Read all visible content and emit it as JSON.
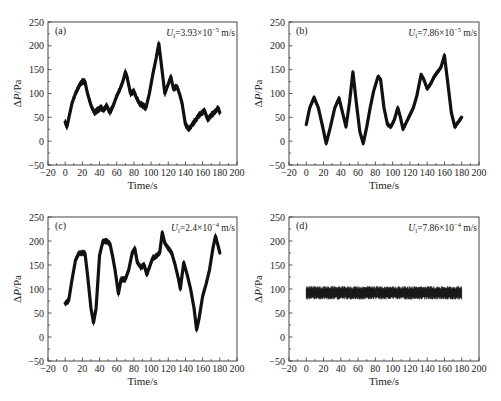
{
  "figure": {
    "layout": "2x2 grid of time-series panels",
    "background": "#ffffff",
    "line_color": "#111111"
  },
  "chart_data": [
    {
      "type": "line",
      "panel_label": "(a)",
      "annotation": {
        "symbol": "U",
        "subscript": "l",
        "text": "=3.93×10",
        "exponent": "−5",
        "unit": " m/s"
      },
      "xlabel": "Time/s",
      "ylabel": "ΔP/Pa",
      "xlim": [
        -20,
        200
      ],
      "ylim": [
        -50,
        250
      ],
      "xticks": [
        -20,
        0,
        20,
        40,
        60,
        80,
        100,
        120,
        140,
        160,
        180,
        200
      ],
      "yticks": [
        -50,
        0,
        50,
        100,
        150,
        200,
        250
      ],
      "grid": false,
      "noise_band": 8,
      "x": [
        0,
        2,
        5,
        8,
        12,
        16,
        20,
        23,
        26,
        30,
        34,
        38,
        42,
        45,
        48,
        52,
        56,
        60,
        64,
        68,
        70,
        72,
        76,
        80,
        82,
        86,
        90,
        94,
        98,
        102,
        106,
        109,
        112,
        116,
        120,
        123,
        126,
        130,
        133,
        136,
        140,
        144,
        148,
        152,
        156,
        160,
        162,
        166,
        170,
        174,
        178,
        180
      ],
      "y": [
        40,
        30,
        55,
        80,
        100,
        115,
        125,
        125,
        100,
        75,
        60,
        65,
        70,
        65,
        75,
        60,
        75,
        95,
        110,
        130,
        145,
        135,
        100,
        105,
        95,
        80,
        75,
        70,
        100,
        140,
        175,
        205,
        160,
        100,
        120,
        135,
        110,
        115,
        100,
        80,
        35,
        25,
        35,
        45,
        55,
        60,
        65,
        45,
        55,
        60,
        70,
        60
      ]
    },
    {
      "type": "line",
      "panel_label": "(b)",
      "annotation": {
        "symbol": "U",
        "subscript": "l",
        "text": "=7.86×10",
        "exponent": "−5",
        "unit": " m/s"
      },
      "xlabel": "Time/s",
      "ylabel": "ΔP/Pa",
      "xlim": [
        -20,
        200
      ],
      "ylim": [
        -50,
        250
      ],
      "xticks": [
        -20,
        0,
        20,
        40,
        60,
        80,
        100,
        120,
        140,
        160,
        180,
        200
      ],
      "yticks": [
        -50,
        0,
        50,
        100,
        150,
        200,
        250
      ],
      "grid": false,
      "noise_band": 6,
      "x": [
        0,
        4,
        9,
        14,
        19,
        23,
        28,
        33,
        38,
        42,
        46,
        50,
        54,
        58,
        62,
        66,
        70,
        74,
        78,
        83,
        86,
        90,
        94,
        98,
        102,
        106,
        109,
        112,
        116,
        120,
        124,
        128,
        133,
        136,
        140,
        144,
        148,
        152,
        156,
        160,
        164,
        168,
        172,
        176,
        180
      ],
      "y": [
        35,
        70,
        92,
        70,
        30,
        -5,
        30,
        70,
        90,
        60,
        30,
        80,
        145,
        80,
        20,
        -5,
        30,
        70,
        105,
        135,
        130,
        70,
        35,
        30,
        45,
        70,
        50,
        25,
        40,
        55,
        70,
        95,
        140,
        130,
        110,
        120,
        135,
        145,
        155,
        180,
        120,
        60,
        30,
        40,
        50
      ]
    },
    {
      "type": "line",
      "panel_label": "(c)",
      "annotation": {
        "symbol": "U",
        "subscript": "l",
        "text": "=2.4×10",
        "exponent": "−4",
        "unit": " m/s"
      },
      "xlabel": "Time/s",
      "ylabel": "ΔP/Pa",
      "xlim": [
        -20,
        200
      ],
      "ylim": [
        -50,
        250
      ],
      "xticks": [
        -20,
        0,
        20,
        40,
        60,
        80,
        100,
        120,
        140,
        160,
        180,
        200
      ],
      "yticks": [
        -50,
        0,
        50,
        100,
        150,
        200,
        250
      ],
      "grid": false,
      "noise_band": 7,
      "x": [
        0,
        4,
        8,
        12,
        16,
        20,
        23,
        26,
        30,
        33,
        36,
        40,
        44,
        48,
        52,
        55,
        58,
        62,
        65,
        70,
        74,
        78,
        81,
        84,
        88,
        92,
        95,
        98,
        102,
        106,
        110,
        113,
        116,
        120,
        124,
        128,
        132,
        134,
        138,
        142,
        146,
        150,
        153,
        156,
        160,
        164,
        168,
        172,
        175,
        178,
        180
      ],
      "y": [
        70,
        75,
        120,
        160,
        175,
        175,
        175,
        130,
        60,
        30,
        60,
        170,
        200,
        200,
        195,
        170,
        140,
        90,
        120,
        120,
        140,
        175,
        185,
        155,
        145,
        150,
        130,
        145,
        165,
        168,
        175,
        218,
        195,
        185,
        175,
        150,
        120,
        100,
        155,
        130,
        100,
        60,
        15,
        40,
        85,
        110,
        140,
        185,
        210,
        190,
        175
      ]
    },
    {
      "type": "line",
      "panel_label": "(d)",
      "annotation": {
        "symbol": "U",
        "subscript": "l",
        "text": "=7.86×10",
        "exponent": "−4",
        "unit": " m/s"
      },
      "xlabel": "Time/s",
      "ylabel": "ΔP/Pa",
      "xlim": [
        -20,
        200
      ],
      "ylim": [
        -50,
        250
      ],
      "xticks": [
        -20,
        0,
        20,
        40,
        60,
        80,
        100,
        120,
        140,
        160,
        180,
        200
      ],
      "yticks": [
        -50,
        0,
        50,
        100,
        150,
        200,
        250
      ],
      "grid": false,
      "noise_band": 0,
      "x": [
        0,
        180
      ],
      "y": [
        92,
        92
      ],
      "band": {
        "x_start": 0,
        "x_end": 180,
        "y_min": 78,
        "y_max": 106,
        "mean": 92
      }
    }
  ],
  "panels": [
    {
      "id": "a",
      "frame": {
        "left": 48,
        "top": 22,
        "right": 237,
        "bottom": 165
      }
    },
    {
      "id": "b",
      "frame": {
        "left": 289,
        "top": 22,
        "right": 479,
        "bottom": 165
      }
    },
    {
      "id": "c",
      "frame": {
        "left": 48,
        "top": 217,
        "right": 237,
        "bottom": 361
      }
    },
    {
      "id": "d",
      "frame": {
        "left": 289,
        "top": 217,
        "right": 479,
        "bottom": 361
      }
    }
  ]
}
